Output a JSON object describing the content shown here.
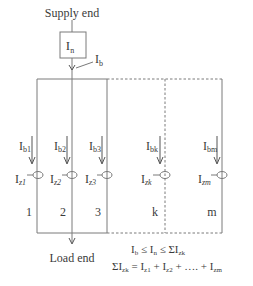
{
  "diagram": {
    "supply_label": "Supply end",
    "load_label": "Load end",
    "device": {
      "label": "I",
      "sub": "n"
    },
    "feed_current": {
      "label": "I",
      "sub": "b"
    },
    "conductors": [
      {
        "index": "1",
        "ib": "I",
        "ib_sub": "b1",
        "iz": "I",
        "iz_sub": "z1",
        "style": "solid"
      },
      {
        "index": "2",
        "ib": "I",
        "ib_sub": "b2",
        "iz": "I",
        "iz_sub": "z2",
        "style": "solid"
      },
      {
        "index": "3",
        "ib": "I",
        "ib_sub": "b3",
        "iz": "I",
        "iz_sub": "z3",
        "style": "solid"
      },
      {
        "index": "k",
        "ib": "I",
        "ib_sub": "bk",
        "iz": "I",
        "iz_sub": "zk",
        "style": "dashed"
      },
      {
        "index": "m",
        "ib": "I",
        "ib_sub": "bm",
        "iz": "I",
        "iz_sub": "zm",
        "style": "solid"
      }
    ],
    "equations": [
      {
        "text": "Ib ≤ In ≤ ΣIzk"
      },
      {
        "text": "ΣIzk = Iz1 + Iz2 + …. + Izm"
      }
    ],
    "colors": {
      "line": "#7a7a7a",
      "text": "#3a3a3a"
    }
  }
}
